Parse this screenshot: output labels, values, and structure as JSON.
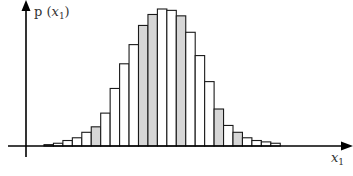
{
  "chart_data": {
    "type": "bar",
    "title": "",
    "xlabel": "x_1",
    "ylabel": "p(x_1)",
    "xlabel_display": {
      "var": "x",
      "sub": "1"
    },
    "ylabel_display": {
      "prefix": "p (",
      "var": "x",
      "sub": "1",
      "suffix": ")"
    },
    "grid": false,
    "legend": null,
    "bin_count": 25,
    "categories": [
      1,
      2,
      3,
      4,
      5,
      6,
      7,
      8,
      9,
      10,
      11,
      12,
      13,
      14,
      15,
      16,
      17,
      18,
      19,
      20,
      21,
      22,
      23,
      24,
      25
    ],
    "values": [
      0.01,
      0.02,
      0.04,
      0.06,
      0.1,
      0.14,
      0.24,
      0.42,
      0.6,
      0.74,
      0.88,
      0.96,
      1.0,
      0.99,
      0.95,
      0.83,
      0.66,
      0.47,
      0.27,
      0.15,
      0.1,
      0.06,
      0.04,
      0.03,
      0.02
    ],
    "highlighted_bins": [
      6,
      11,
      12,
      15,
      19,
      21
    ],
    "ylim": [
      0,
      1.05
    ],
    "colors": {
      "bar_fill": "#ffffff",
      "highlight_fill": "#d6d6d6",
      "stroke": "#1a1a1a",
      "axis": "#000000"
    }
  }
}
